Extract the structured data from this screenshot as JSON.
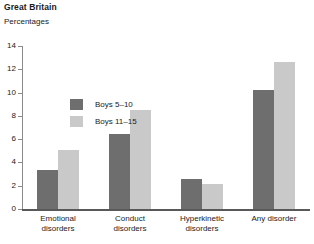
{
  "header": {
    "title": "Great Britain",
    "subtitle": "Percentages"
  },
  "chart_data": {
    "type": "bar",
    "title": "Great Britain",
    "subtitle": "Percentages",
    "xlabel": "",
    "ylabel": "Percentages",
    "ylim": [
      0,
      14
    ],
    "yticks": [
      0,
      2,
      4,
      6,
      8,
      10,
      12,
      14
    ],
    "grid": false,
    "legend_position": "inside-top-left",
    "categories": [
      "Emotional disorders",
      "Conduct disorders",
      "Hyperkinetic disorders",
      "Any disorder"
    ],
    "category_lines": [
      [
        "Emotional",
        "disorders"
      ],
      [
        "Conduct",
        "disorders"
      ],
      [
        "Hyperkinetic",
        "disorders"
      ],
      [
        "Any disorder"
      ]
    ],
    "series": [
      {
        "name": "Boys 5–10",
        "color": "#6e6e6e",
        "values": [
          3.3,
          6.4,
          2.5,
          10.2
        ]
      },
      {
        "name": "Boys 11–15",
        "color": "#c9c9c9",
        "values": [
          5.0,
          8.5,
          2.1,
          12.6
        ]
      }
    ]
  }
}
